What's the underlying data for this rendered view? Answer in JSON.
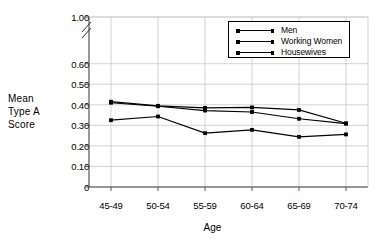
{
  "chart_data": {
    "type": "line",
    "title": "",
    "xlabel": "Age",
    "ylabel": "Mean Type A Score",
    "ylabel_lines": [
      "Mean",
      "Type A",
      "Score"
    ],
    "categories": [
      "45-49",
      "50-54",
      "55-59",
      "60-64",
      "65-69",
      "70-74"
    ],
    "ytick_labels": [
      "1.00",
      "0.60",
      "0.50",
      "0.40",
      "0.30",
      "0.20",
      "0.10",
      "0"
    ],
    "ytick_values": [
      1.0,
      0.6,
      0.5,
      0.4,
      0.3,
      0.2,
      0.1,
      0
    ],
    "ylim": [
      0,
      1.0
    ],
    "axis_break": true,
    "axis_break_between": [
      0.6,
      1.0
    ],
    "grid": true,
    "legend_position": "top-right",
    "series": [
      {
        "name": "Men",
        "values": [
          0.415,
          0.395,
          0.385,
          0.387,
          0.375,
          0.31
        ]
      },
      {
        "name": "Working Women",
        "values": [
          0.41,
          0.393,
          0.372,
          0.365,
          0.332,
          0.308
        ]
      },
      {
        "name": "Housewives",
        "values": [
          0.325,
          0.343,
          0.262,
          0.278,
          0.244,
          0.256
        ]
      }
    ],
    "line_color": "#000000",
    "grid_color": "#c8c8c8",
    "axis_color": "#555555"
  },
  "legend": {
    "items": [
      {
        "label": "Men"
      },
      {
        "label": "Working Women"
      },
      {
        "label": "Housewives"
      }
    ]
  }
}
